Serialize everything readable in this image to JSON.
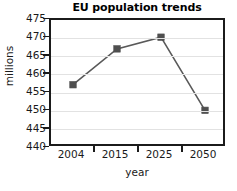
{
  "chart_data": {
    "type": "line",
    "title": "EU population trends",
    "xlabel": "year",
    "ylabel": "millions",
    "categories": [
      "2004",
      "2015",
      "2025",
      "2050"
    ],
    "values": [
      457.3,
      467.1,
      470.3,
      450.3
    ],
    "series": [
      {
        "name": "EU population",
        "values": [
          457.3,
          467.1,
          470.3,
          450.3
        ]
      }
    ],
    "ylim": [
      440,
      475
    ],
    "yticks": [
      "440",
      "445",
      "450",
      "455",
      "460",
      "465",
      "470",
      "475"
    ],
    "ytick_values": [
      440,
      445,
      450,
      455,
      460,
      465,
      470,
      475
    ],
    "grid": "horizontal",
    "legend": "none",
    "marker": "square",
    "colors": {
      "line": "#595959",
      "marker": "#4f4f4f",
      "gridline": "#e2e2e2",
      "frame": "#1b1b1b",
      "background": "#ffffff",
      "text": "#1a1a1a"
    }
  }
}
